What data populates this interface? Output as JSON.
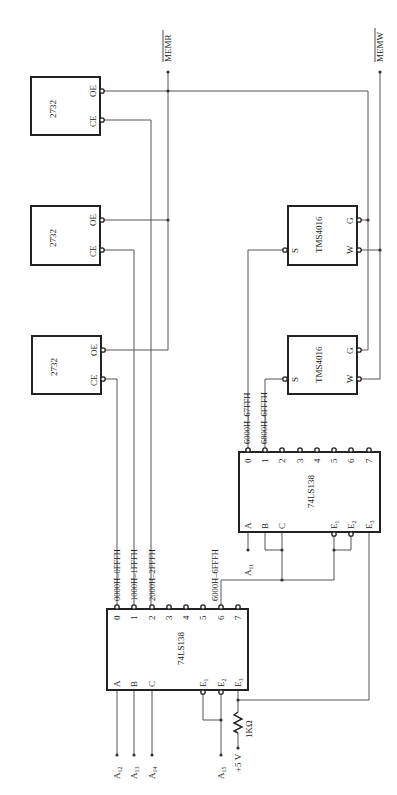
{
  "diagram": {
    "orientation": "rotated-90-ccw",
    "signals": {
      "memr": "MEMR",
      "memw": "MEMW",
      "a11": "A",
      "a11_sub": "11",
      "a12": "A",
      "a12_sub": "12",
      "a13": "A",
      "a13_sub": "13",
      "a14": "A",
      "a14_sub": "14",
      "a15": "A",
      "a15_sub": "15",
      "vcc": "+5 V",
      "resistor": "1KΩ"
    },
    "eproms": [
      {
        "part": "2732",
        "ce": "CE",
        "oe": "OE"
      },
      {
        "part": "2732",
        "ce": "CE",
        "oe": "OE"
      },
      {
        "part": "2732",
        "ce": "CE",
        "oe": "OE"
      }
    ],
    "rams": [
      {
        "part": "TMS4016",
        "s": "S",
        "w": "W",
        "g": "G"
      },
      {
        "part": "TMS4016",
        "s": "S",
        "w": "W",
        "g": "G"
      }
    ],
    "decoder1": {
      "part": "74LS138",
      "inputs": [
        "A",
        "B",
        "C"
      ],
      "enables": [
        "E",
        "E",
        "E"
      ],
      "enable_subs": [
        "1",
        "2",
        "3"
      ],
      "outputs": [
        "0",
        "1",
        "2",
        "3",
        "4",
        "5",
        "6",
        "7"
      ],
      "ranges": {
        "o0": "0000H–0FFFH",
        "o1": "1000H–1FFFH",
        "o2": "2000H–2FFFH",
        "o6": "6000H–6FFFH"
      }
    },
    "decoder2": {
      "part": "74LS138",
      "inputs": [
        "A",
        "B",
        "C"
      ],
      "enables": [
        "E",
        "E",
        "E"
      ],
      "enable_subs": [
        "1",
        "2",
        "3"
      ],
      "outputs": [
        "0",
        "1",
        "2",
        "3",
        "4",
        "5",
        "6",
        "7"
      ],
      "ranges": {
        "o0": "6000H–67FFH",
        "o1": "6800H–6FFFH"
      }
    }
  }
}
